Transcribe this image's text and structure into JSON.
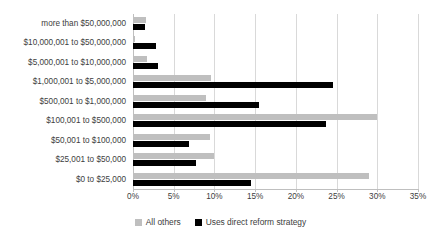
{
  "chart_data": {
    "type": "bar",
    "orientation": "horizontal",
    "title": "",
    "subtitle": "",
    "xlabel": "",
    "ylabel": "",
    "xlim": [
      0,
      35
    ],
    "xticks": [
      0,
      5,
      10,
      15,
      20,
      25,
      30,
      35
    ],
    "xtick_labels": [
      "0%",
      "5%",
      "10%",
      "15%",
      "20%",
      "25%",
      "30%",
      "35%"
    ],
    "grid": true,
    "grid_axis": "x",
    "legend_position": "bottom",
    "categories": [
      "more than $50,000,000",
      "$10,000,001 to $50,000,000",
      "$5,000,001 to $10,000,000",
      "$1,000,001 to $5,000,000",
      "$500,001 to $1,000,000",
      "$100,001 to $500,000",
      "$50,001 to $100,000",
      "$25,001 to $50,000",
      "$0 to $25,000"
    ],
    "series": [
      {
        "name": "All others",
        "color": "#bfbfbf",
        "values": [
          1.6,
          0.2,
          1.7,
          9.6,
          9.0,
          30.0,
          9.4,
          10.0,
          29.0
        ]
      },
      {
        "name": "Uses direct reform strategy",
        "color": "#000000",
        "values": [
          1.5,
          2.8,
          3.1,
          24.6,
          15.5,
          23.7,
          6.9,
          7.7,
          14.5
        ]
      }
    ]
  },
  "legend": {
    "items": [
      {
        "label": "All others",
        "swatch": "#bfbfbf"
      },
      {
        "label": "Uses direct reform strategy",
        "swatch": "#000000"
      }
    ]
  }
}
